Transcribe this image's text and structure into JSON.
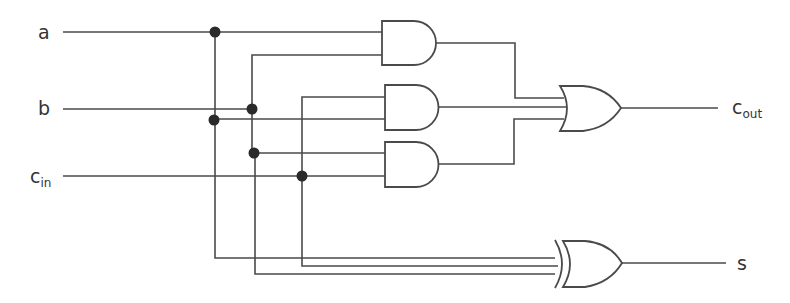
{
  "diagram": {
    "inputs": [
      {
        "id": "a",
        "label": "a",
        "sub": ""
      },
      {
        "id": "b",
        "label": "b",
        "sub": ""
      },
      {
        "id": "cin",
        "label": "c",
        "sub": "in"
      }
    ],
    "outputs": [
      {
        "id": "cout",
        "label": "c",
        "sub": "out"
      },
      {
        "id": "s",
        "label": "s",
        "sub": ""
      }
    ],
    "gates": [
      {
        "id": "and1",
        "type": "AND",
        "inputs": [
          "a",
          "b"
        ]
      },
      {
        "id": "and2",
        "type": "AND",
        "inputs": [
          "cin",
          "a"
        ]
      },
      {
        "id": "and3",
        "type": "AND",
        "inputs": [
          "b",
          "cin"
        ]
      },
      {
        "id": "or1",
        "type": "OR",
        "inputs": [
          "and1",
          "and2",
          "and3"
        ],
        "output": "cout"
      },
      {
        "id": "xor1",
        "type": "XOR",
        "inputs": [
          "a",
          "cin",
          "b"
        ],
        "output": "s"
      }
    ],
    "colors": {
      "wire": "#4a4a4a",
      "junction": "#2a2a2a",
      "background": "#ffffff"
    }
  }
}
